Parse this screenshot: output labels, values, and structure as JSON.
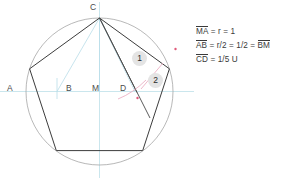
{
  "figure": {
    "title_hidden": "",
    "background_color": "#ffffff",
    "circle": {
      "center_x": 99.5,
      "center_y": 91.5,
      "radius": 73.5,
      "stroke": "#9a9a9a",
      "stroke_width": 0.7
    },
    "pentagon": {
      "stroke": "#3c3c3c",
      "stroke_width": 1.0,
      "vertices": [
        {
          "name": "C",
          "x": 99.5,
          "y": 18.0
        },
        {
          "name": "E2",
          "x": 169.4,
          "y": 68.8
        },
        {
          "name": "E3",
          "x": 142.7,
          "y": 150.6
        },
        {
          "name": "E4",
          "x": 56.3,
          "y": 150.6
        },
        {
          "name": "E1",
          "x": 29.6,
          "y": 68.8
        }
      ]
    },
    "axes": {
      "stroke": "#bcdfe8",
      "stroke_width": 0.8,
      "horizontal": {
        "x1": 0,
        "y1": 91.5,
        "x2": 194,
        "y2": 91.5
      },
      "vertical": {
        "x1": 99.5,
        "y1": 2,
        "x2": 99.5,
        "y2": 178
      }
    },
    "construction_lines": {
      "stroke": "#b9dde9",
      "stroke_width": 0.8,
      "segments": [
        {
          "label": "C-to-B",
          "x1": 99.5,
          "y1": 18.0,
          "x2": 57.0,
          "y2": 91.5
        },
        {
          "label": "C-to-M",
          "x1": 99.5,
          "y1": 18.0,
          "x2": 99.5,
          "y2": 91.5
        },
        {
          "label": "C-to-D",
          "x1": 99.5,
          "y1": 18.0,
          "x2": 135.0,
          "y2": 91.5
        },
        {
          "label": "B-tick",
          "x1": 57.0,
          "y1": 78.0,
          "x2": 57.0,
          "y2": 99.0
        }
      ]
    },
    "chords": {
      "stroke": "#4a4a4a",
      "stroke_width": 0.9,
      "segments": [
        {
          "label": "C-to-D-chord",
          "x1": 99.5,
          "y1": 18.0,
          "x2": 137.0,
          "y2": 92.5
        },
        {
          "label": "C-to-E2-ray",
          "x1": 99.5,
          "y1": 18.0,
          "x2": 150.0,
          "y2": 118.0
        }
      ]
    },
    "arcs": {
      "stroke": "#e8a6bc",
      "stroke_width": 0.8,
      "paths": [
        {
          "label": "arc-1",
          "d": "M 118 99 Q 133 93 146 80"
        },
        {
          "label": "arc-2",
          "d": "M 141 89 Q 152 76 163 63"
        }
      ]
    },
    "markers": {
      "color": "#e05a7a",
      "points": [
        {
          "label": "marker-upper-right",
          "x": 175.5,
          "y": 49.0
        },
        {
          "label": "marker-lower",
          "x": 137.5,
          "y": 98.0
        }
      ]
    },
    "point_labels": [
      {
        "name": "C",
        "text": "C",
        "x": 90.0,
        "y": 2.0
      },
      {
        "name": "A",
        "text": "A",
        "x": 7.0,
        "y": 83.0
      },
      {
        "name": "B",
        "text": "B",
        "x": 66.0,
        "y": 83.0
      },
      {
        "name": "M",
        "text": "M",
        "x": 92.0,
        "y": 83.0
      },
      {
        "name": "D",
        "text": "D",
        "x": 120.0,
        "y": 83.0
      }
    ],
    "number_badges": [
      {
        "name": "badge-1",
        "text": "1",
        "x": 132.0,
        "y": 51.0
      },
      {
        "name": "badge-2",
        "text": "2",
        "x": 148.0,
        "y": 73.0
      }
    ]
  },
  "annotations": {
    "line1": {
      "seg": "MA",
      "rest": " = r = 1"
    },
    "line2": {
      "seg": "AB",
      "mid": " = r/2 = 1/2 = ",
      "seg2": "BM"
    },
    "line3": {
      "seg": "CD",
      "rest": " = 1/5 U"
    }
  }
}
